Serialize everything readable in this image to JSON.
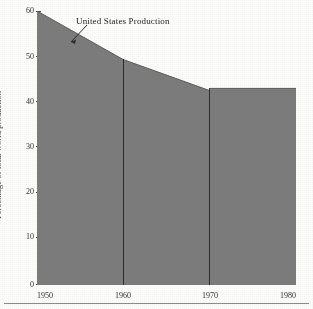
{
  "chart_data": {
    "type": "area",
    "title": "",
    "xlabel": "",
    "ylabel": "Percentage of total world production",
    "xlim": [
      1950,
      1980
    ],
    "ylim": [
      0,
      62
    ],
    "grid": false,
    "legend_position": "none",
    "x": [
      1950,
      1960,
      1970,
      1980
    ],
    "xticklabels": [
      "1950",
      "1960",
      "1970",
      "1980"
    ],
    "yticklabels": [
      "0",
      "10",
      "20",
      "30",
      "40",
      "50",
      "60"
    ],
    "yticks": [
      0,
      10,
      20,
      30,
      40,
      50,
      60
    ],
    "series": [
      {
        "name": "United States Production",
        "values": [
          62,
          51,
          44,
          44.5
        ],
        "fill_color": "#7c7c7c",
        "points": [
          {
            "x": 1950,
            "y": 62
          },
          {
            "x": 1960,
            "y": 51
          },
          {
            "x": 1970,
            "y": 44
          },
          {
            "x": 1970,
            "y": 44.5
          },
          {
            "x": 1980,
            "y": 44.5
          }
        ]
      }
    ],
    "annotations": [
      {
        "text": "United States Production",
        "target_x": 1957,
        "target_y": 56
      }
    ],
    "dividers": [
      1960,
      1970
    ]
  },
  "axes": {
    "y_label": "Percentage of total world production",
    "y_ticks": [
      "60",
      "50",
      "40",
      "30",
      "20",
      "10",
      "0"
    ],
    "x_ticks": [
      "1950",
      "1960",
      "1970",
      "1980"
    ]
  },
  "annotation": {
    "label": "United States Production"
  },
  "colors": {
    "area_fill": "#7c7c7c",
    "axis": "#4a4a4a",
    "text": "#2b2b2b",
    "divider": "#1f1f1f",
    "background": "#fdfdfc",
    "rule": "#8d8d8d"
  }
}
